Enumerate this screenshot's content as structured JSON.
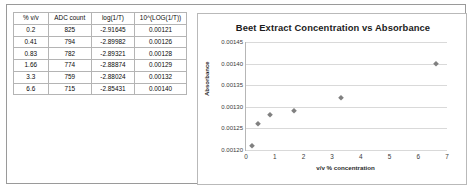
{
  "table": {
    "headers": [
      "% v/v",
      "ADC count",
      "log(1/T)",
      "10^(LOG(1/T))"
    ],
    "rows": [
      [
        "0.2",
        "825",
        "-2.91645",
        "0.00121"
      ],
      [
        "0.41",
        "794",
        "-2.89982",
        "0.00126"
      ],
      [
        "0.83",
        "782",
        "-2.89321",
        "0.00128"
      ],
      [
        "1.66",
        "774",
        "-2.88874",
        "0.00129"
      ],
      [
        "3.3",
        "759",
        "-2.88024",
        "0.00132"
      ],
      [
        "6.6",
        "715",
        "-2.85431",
        "0.00140"
      ]
    ]
  },
  "chart_data": {
    "type": "scatter",
    "title": "Beet Extract Concentration vs Absorbance",
    "xlabel": "v/v % concentration",
    "ylabel": "Absorbance",
    "xlim": [
      0,
      7
    ],
    "ylim": [
      0.0012,
      0.00145
    ],
    "grid": true,
    "legend": null,
    "xticks": [
      "0",
      "1",
      "2",
      "3",
      "4",
      "5",
      "6",
      "7"
    ],
    "xtick_values": [
      0,
      1,
      2,
      3,
      4,
      5,
      6,
      7
    ],
    "yticks": [
      "0.00120",
      "0.00125",
      "0.00130",
      "0.00135",
      "0.00140",
      "0.00145"
    ],
    "ytick_values": [
      0.0012,
      0.00125,
      0.0013,
      0.00135,
      0.0014,
      0.00145
    ],
    "marker": "diamond",
    "marker_color": "#808080",
    "x": [
      0.2,
      0.41,
      0.83,
      1.66,
      3.3,
      6.6
    ],
    "y": [
      0.00121,
      0.00126,
      0.00128,
      0.00129,
      0.00132,
      0.0014
    ]
  },
  "colors": {
    "panel_border": "#9a9a9a",
    "chart_border": "#b9b9b9",
    "gridline": "#d9d9d9",
    "axis": "#b6b6b6",
    "marker": "#808080",
    "text": "#1c1c1c"
  }
}
